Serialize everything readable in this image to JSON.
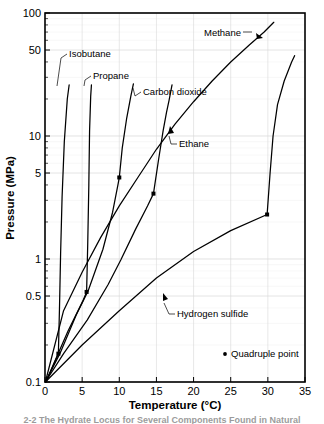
{
  "figure": {
    "caption": "2-2   The Hydrate Locus for Several Components Found in Natural"
  },
  "chart_data": {
    "type": "line",
    "title": "",
    "xlabel": "Temperature (°C)",
    "ylabel": "Pressure (MPa)",
    "xscale": "linear",
    "yscale": "log",
    "xlim": [
      0,
      35
    ],
    "ylim": [
      0.1,
      100
    ],
    "xticks": [
      0,
      5,
      10,
      15,
      20,
      25,
      30,
      35
    ],
    "xticklabels": [
      "0",
      "5",
      "10",
      "15",
      "20",
      "25",
      "30",
      "35"
    ],
    "yticks": [
      0.1,
      0.5,
      1,
      5,
      10,
      50,
      100
    ],
    "yticklabels": [
      "0.1",
      "0.5",
      "1",
      "5",
      "10",
      "50",
      "100"
    ],
    "grid": true,
    "legend": {
      "position": "inside-bottom-right",
      "entries": [
        {
          "marker": "dot",
          "label": "Quadruple point"
        }
      ]
    },
    "series": [
      {
        "name": "Isobutane",
        "label": "Isobutane",
        "quadruple_point": {
          "x": 1.8,
          "y": 0.17
        },
        "points": [
          [
            0.15,
            0.1
          ],
          [
            1.3,
            0.145
          ],
          [
            1.8,
            0.17
          ],
          [
            1.95,
            0.4
          ],
          [
            2.1,
            1.1
          ],
          [
            2.3,
            3.2
          ],
          [
            2.6,
            9.0
          ],
          [
            3.0,
            20.0
          ],
          [
            3.25,
            26.0
          ]
        ]
      },
      {
        "name": "Propane",
        "label": "Propane",
        "quadruple_point": {
          "x": 5.6,
          "y": 0.54
        },
        "points": [
          [
            0.1,
            0.1
          ],
          [
            3.1,
            0.26
          ],
          [
            5.05,
            0.45
          ],
          [
            5.6,
            0.54
          ],
          [
            5.75,
            1.3
          ],
          [
            5.9,
            4.0
          ],
          [
            6.0,
            11.0
          ],
          [
            6.15,
            21.0
          ],
          [
            6.25,
            26.0
          ]
        ]
      },
      {
        "name": "Carbon dioxide",
        "label": "Carbon dioxide",
        "quadruple_point": {
          "x": 10.0,
          "y": 4.6
        },
        "points": [
          [
            0.05,
            0.1
          ],
          [
            2.0,
            0.17
          ],
          [
            4.2,
            0.35
          ],
          [
            5.8,
            0.55
          ],
          [
            7.8,
            1.2
          ],
          [
            9.1,
            2.4
          ],
          [
            9.85,
            4.1
          ],
          [
            10.0,
            4.6
          ],
          [
            10.4,
            8.0
          ],
          [
            11.0,
            14.0
          ],
          [
            11.55,
            21.0
          ],
          [
            11.9,
            26.5
          ]
        ]
      },
      {
        "name": "Ethane",
        "label": "Ethane",
        "quadruple_point": {
          "x": 14.6,
          "y": 3.4
        },
        "points": [
          [
            0.05,
            0.1
          ],
          [
            2.5,
            0.17
          ],
          [
            5.7,
            0.32
          ],
          [
            8.5,
            0.62
          ],
          [
            10.2,
            0.98
          ],
          [
            12.2,
            1.75
          ],
          [
            13.8,
            2.7
          ],
          [
            14.6,
            3.4
          ],
          [
            15.3,
            6.5
          ],
          [
            15.9,
            11.0
          ],
          [
            16.35,
            15.5
          ],
          [
            16.7,
            19.5
          ],
          [
            17.1,
            26.0
          ]
        ]
      },
      {
        "name": "Methane",
        "label": "Methane",
        "quadruple_point": null,
        "points": [
          [
            0.05,
            0.1
          ],
          [
            2.5,
            0.38
          ],
          [
            5.0,
            0.78
          ],
          [
            7.5,
            1.5
          ],
          [
            10.0,
            2.7
          ],
          [
            12.5,
            4.6
          ],
          [
            15.0,
            7.8
          ],
          [
            17.5,
            12.5
          ],
          [
            20.0,
            19.0
          ],
          [
            22.5,
            28.0
          ],
          [
            25.0,
            40.0
          ],
          [
            27.5,
            55.0
          ],
          [
            29.5,
            70.0
          ],
          [
            30.8,
            84.0
          ]
        ]
      },
      {
        "name": "Hydrogen sulfide",
        "label": "Hydrogen sulfide",
        "quadruple_point": {
          "x": 29.9,
          "y": 2.3
        },
        "points": [
          [
            0.05,
            0.1
          ],
          [
            5.0,
            0.2
          ],
          [
            10.0,
            0.38
          ],
          [
            15.0,
            0.7
          ],
          [
            20.0,
            1.15
          ],
          [
            25.0,
            1.7
          ],
          [
            29.9,
            2.3
          ],
          [
            30.3,
            5.0
          ],
          [
            30.7,
            10.0
          ],
          [
            31.3,
            18.0
          ],
          [
            32.2,
            28.0
          ],
          [
            33.2,
            40.0
          ],
          [
            33.6,
            45.0
          ]
        ]
      }
    ],
    "annotations": [
      {
        "label": "Isobutane",
        "text_x": 69,
        "text_y": 57,
        "anchor": "start"
      },
      {
        "label": "Propane",
        "text_x": 93,
        "text_y": 79,
        "anchor": "start"
      },
      {
        "label": "Carbon dioxide",
        "text_x": 143,
        "text_y": 95,
        "anchor": "start"
      },
      {
        "label": "Methane",
        "text_x": 204,
        "text_y": 36,
        "anchor": "start"
      },
      {
        "label": "Ethane",
        "text_x": 179,
        "text_y": 147,
        "anchor": "start"
      },
      {
        "label": "Hydrogen sulfide",
        "text_x": 177,
        "text_y": 317,
        "anchor": "start"
      },
      {
        "label": "Quadruple point",
        "text_x": 231,
        "text_y": 357,
        "anchor": "start"
      }
    ]
  }
}
